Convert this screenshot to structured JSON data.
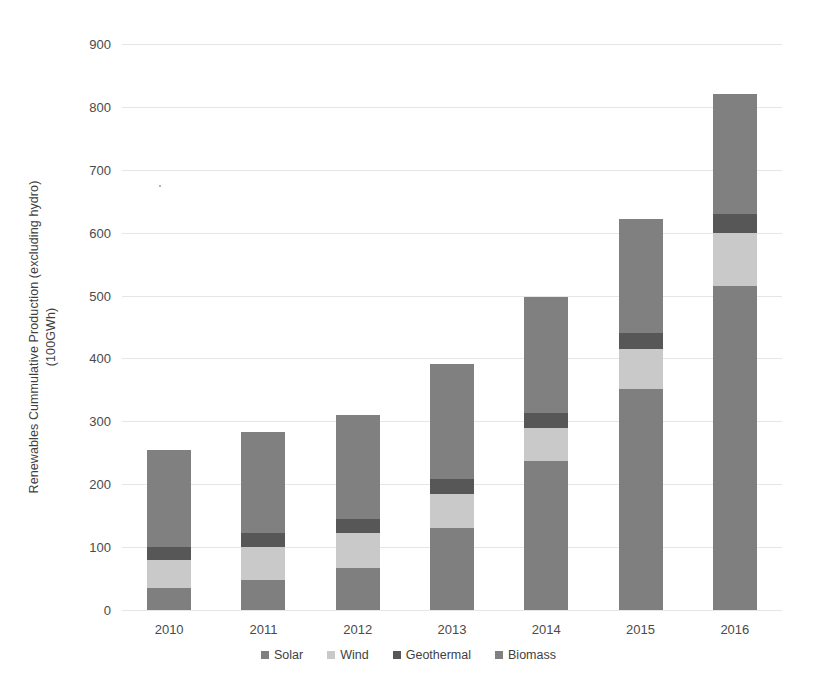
{
  "chart_data": {
    "type": "bar",
    "stacked": true,
    "title": "",
    "xlabel": "",
    "ylabel": "Renewables Cummulative Production (excluding hydro)\n(100GWh)",
    "categories": [
      "2010",
      "2011",
      "2012",
      "2013",
      "2014",
      "2015",
      "2016"
    ],
    "series": [
      {
        "name": "Solar",
        "color": "#7f7f7f",
        "values": [
          35,
          48,
          67,
          130,
          237,
          352,
          515
        ]
      },
      {
        "name": "Wind",
        "color": "#c9c9c9",
        "values": [
          45,
          52,
          55,
          55,
          53,
          63,
          85
        ]
      },
      {
        "name": "Geothermal",
        "color": "#575757",
        "values": [
          20,
          22,
          23,
          23,
          23,
          25,
          30
        ]
      },
      {
        "name": "Biomass",
        "color": "#808080",
        "values": [
          155,
          161,
          165,
          184,
          185,
          182,
          190
        ]
      }
    ],
    "totals": [
      255,
      283,
      310,
      392,
      498,
      622,
      820
    ],
    "ylim": [
      0,
      900
    ],
    "ytick_values": [
      0,
      100,
      200,
      300,
      400,
      500,
      600,
      700,
      800,
      900
    ],
    "ytick_labels": [
      "0",
      "100",
      "200",
      "300",
      "400",
      "500",
      "600",
      "700",
      "800",
      "900"
    ],
    "grid": true,
    "legend_position": "bottom",
    "legend_entries": [
      "Solar",
      "Wind",
      "Geothermal",
      "Biomass"
    ]
  },
  "colors": {
    "background": "#ffffff",
    "gridline": "#e6e6e6",
    "axis_text": "#4a4a4a",
    "title_text": "#3f3f3f"
  }
}
